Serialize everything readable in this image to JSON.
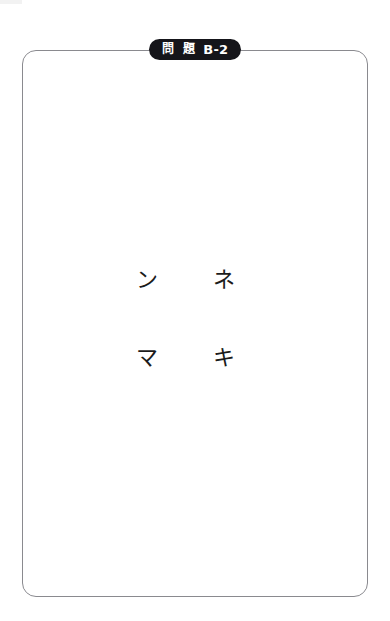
{
  "page": {
    "background_color": "#ffffff",
    "sheet_border_color": "#8a8a8f"
  },
  "badge": {
    "label_kanji": "問 題",
    "label_code": "B-2",
    "full_label": "問題 B-2",
    "background_color": "#15151a",
    "text_color": "#ffffff"
  },
  "card": {
    "name": "problem-area",
    "content_note": ""
  },
  "kana_grid": {
    "rows": [
      {
        "cells": [
          {
            "char": "ン"
          },
          {
            "char": "ネ"
          }
        ]
      },
      {
        "cells": [
          {
            "char": "マ"
          },
          {
            "char": "キ"
          }
        ]
      }
    ]
  }
}
